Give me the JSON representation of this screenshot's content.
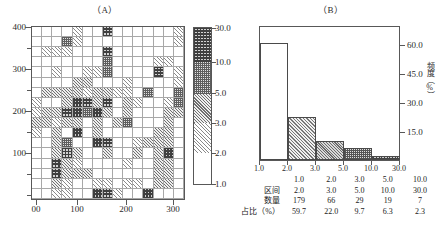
{
  "figure": {
    "panel_a": {
      "title": "（A）",
      "type": "grid-map",
      "y_ticks": [
        "400",
        "300",
        "200",
        "100"
      ],
      "x_ticks": [
        "00",
        "100",
        "200",
        "300"
      ]
    },
    "colorbar": {
      "labels": [
        "30.0",
        "10.0",
        "5.0",
        "3.0",
        "2.0",
        "1.0"
      ]
    },
    "panel_b": {
      "title": "（B）",
      "y_axis_label": "频度（%）",
      "y_ticks": [
        "60.0",
        "45.0",
        "30.0",
        "15.0"
      ],
      "x_ticks": [
        "1.0",
        "2.0",
        "3.0",
        "5.0",
        "10.0",
        "30.0"
      ]
    },
    "table": {
      "row_labels": [
        "区间",
        "数量",
        "占比（%）"
      ],
      "interval_lower": [
        "1.0",
        "2.0",
        "3.0",
        "5.0",
        "10.0"
      ],
      "interval_upper": [
        "2.0",
        "3.0",
        "5.0",
        "10.0",
        "30.0"
      ],
      "counts": [
        "179",
        "66",
        "29",
        "19",
        "7"
      ],
      "percents": [
        "59.7",
        "22.0",
        "9.7",
        "6.3",
        "2.3"
      ]
    }
  },
  "chart_data": [
    {
      "type": "heatmap",
      "title": "（A）",
      "xlabel": "",
      "ylabel": "",
      "xlim": [
        0,
        300
      ],
      "ylim": [
        0,
        440
      ],
      "xtick_values": [
        0,
        100,
        200,
        300
      ],
      "xtick_labels": [
        "00",
        "100",
        "200",
        "300"
      ],
      "ytick_values": [
        100,
        200,
        300,
        400
      ],
      "ytick_labels": [
        "100",
        "200",
        "300",
        "400"
      ],
      "grid": true,
      "ncols": 15,
      "nrows": 17,
      "legend_position": "right-colorbar",
      "colorbar": {
        "tick_labels": [
          "30.0",
          "10.0",
          "5.0",
          "3.0",
          "2.0",
          "1.0"
        ],
        "tick_values": [
          30.0,
          10.0,
          5.0,
          3.0,
          2.0,
          1.0
        ],
        "bins": [
          {
            "range": [
              10.0,
              30.0
            ],
            "pattern": "dense-cross-hatch",
            "level": 5
          },
          {
            "range": [
              5.0,
              10.0
            ],
            "pattern": "cross-hatch",
            "level": 4
          },
          {
            "range": [
              3.0,
              5.0
            ],
            "pattern": "solid-gray",
            "level": 3
          },
          {
            "range": [
              2.0,
              3.0
            ],
            "pattern": "diagonal-hatch",
            "level": 2
          },
          {
            "range": [
              1.0,
              2.0
            ],
            "pattern": "blank",
            "level": 1
          }
        ]
      },
      "cells": [
        [
          1,
          1,
          1,
          1,
          2,
          1,
          1,
          5,
          1,
          1,
          1,
          1,
          1,
          1,
          2
        ],
        [
          1,
          1,
          1,
          4,
          2,
          1,
          1,
          1,
          1,
          1,
          1,
          1,
          1,
          1,
          2
        ],
        [
          1,
          2,
          2,
          2,
          1,
          1,
          1,
          5,
          1,
          1,
          1,
          1,
          1,
          1,
          1
        ],
        [
          1,
          1,
          1,
          1,
          1,
          1,
          1,
          4,
          1,
          1,
          1,
          1,
          2,
          2,
          1
        ],
        [
          1,
          1,
          2,
          1,
          1,
          2,
          2,
          4,
          1,
          1,
          1,
          1,
          5,
          1,
          2
        ],
        [
          1,
          1,
          1,
          1,
          3,
          3,
          1,
          1,
          1,
          2,
          1,
          1,
          1,
          1,
          2
        ],
        [
          1,
          3,
          3,
          3,
          3,
          2,
          3,
          3,
          2,
          2,
          1,
          4,
          1,
          1,
          4
        ],
        [
          2,
          1,
          1,
          3,
          5,
          5,
          3,
          5,
          1,
          3,
          2,
          1,
          1,
          2,
          4
        ],
        [
          2,
          3,
          3,
          5,
          5,
          4,
          5,
          3,
          1,
          3,
          1,
          1,
          1,
          3,
          3
        ],
        [
          3,
          3,
          2,
          3,
          3,
          1,
          3,
          1,
          3,
          4,
          1,
          1,
          1,
          3,
          1
        ],
        [
          2,
          1,
          3,
          1,
          5,
          1,
          3,
          1,
          1,
          1,
          1,
          1,
          3,
          3,
          1
        ],
        [
          1,
          1,
          3,
          4,
          1,
          1,
          5,
          5,
          1,
          1,
          2,
          3,
          3,
          3,
          1
        ],
        [
          1,
          1,
          3,
          5,
          3,
          1,
          1,
          3,
          1,
          1,
          3,
          1,
          3,
          5,
          1
        ],
        [
          1,
          1,
          5,
          3,
          2,
          1,
          1,
          1,
          1,
          2,
          1,
          1,
          3,
          3,
          1
        ],
        [
          1,
          1,
          5,
          3,
          3,
          3,
          1,
          1,
          1,
          1,
          1,
          1,
          3,
          3,
          1
        ],
        [
          1,
          1,
          3,
          2,
          1,
          1,
          2,
          2,
          1,
          2,
          2,
          1,
          3,
          3,
          1
        ],
        [
          1,
          1,
          2,
          2,
          1,
          1,
          5,
          5,
          2,
          1,
          1,
          5,
          1,
          1,
          1
        ]
      ]
    },
    {
      "type": "bar",
      "title": "（B）",
      "xlabel": "",
      "ylabel": "频度（%）",
      "categories": [
        "1.0-2.0",
        "2.0-3.0",
        "3.0-5.0",
        "5.0-10.0",
        "10.0-30.0"
      ],
      "xtick_labels": [
        "1.0",
        "2.0",
        "3.0",
        "5.0",
        "10.0",
        "30.0"
      ],
      "values": [
        59.7,
        22.0,
        9.7,
        6.3,
        2.3
      ],
      "counts": [
        179,
        66,
        29,
        19,
        7
      ],
      "ylim": [
        0,
        68
      ],
      "ytick_values": [
        15.0,
        30.0,
        45.0,
        60.0
      ],
      "ytick_labels": [
        "15.0",
        "30.0",
        "45.0",
        "60.0"
      ],
      "grid": false,
      "legend_position": "none",
      "y_axis_side": "right"
    },
    {
      "type": "table",
      "row_labels": [
        "区间",
        "数量",
        "占比（%）"
      ],
      "columns": [
        "1.0-2.0",
        "2.0-3.0",
        "3.0-5.0",
        "5.0-10.0",
        "10.0-30.0"
      ],
      "rows": [
        [
          "1.0",
          "2.0",
          "3.0",
          "5.0",
          "10.0"
        ],
        [
          "2.0",
          "3.0",
          "5.0",
          "10.0",
          "30.0"
        ],
        [
          "179",
          "66",
          "29",
          "19",
          "7"
        ],
        [
          "59.7",
          "22.0",
          "9.7",
          "6.3",
          "2.3"
        ]
      ]
    }
  ]
}
